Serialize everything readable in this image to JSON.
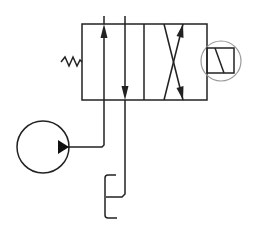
{
  "diagram": {
    "components": [
      {
        "id": "valve",
        "label": "4/2 directional control valve"
      },
      {
        "id": "spring",
        "label": "spring return"
      },
      {
        "id": "solenoid",
        "label": "solenoid actuator"
      },
      {
        "id": "pump",
        "label": "hydraulic pump"
      },
      {
        "id": "tank",
        "label": "tank / reservoir"
      }
    ],
    "colors": {
      "line": "#222222",
      "solenoid_circle": "#999999",
      "background": "#ffffff"
    }
  }
}
